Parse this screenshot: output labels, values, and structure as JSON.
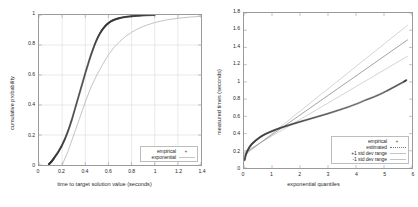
{
  "figure": {
    "background": "#ffffff",
    "frame_color": "#9a9a9a",
    "grid_color": "#d9d9d9",
    "empirical_color": "#3a3a3a",
    "fit_color": "#a8a8a8",
    "band_color": "#c9c9c9"
  },
  "chart_data": [
    {
      "type": "line",
      "title": "",
      "xlabel": "time to target solution value (seconds)",
      "ylabel": "cumulative probability",
      "xlim": [
        0,
        1.4
      ],
      "ylim": [
        0,
        1
      ],
      "xticks": [
        "0",
        "0.2",
        "0.4",
        "0.6",
        "0.8",
        "1",
        "1.2",
        "1.4"
      ],
      "xtick_values": [
        0,
        0.2,
        0.4,
        0.6,
        0.8,
        1,
        1.2,
        1.4
      ],
      "yticks": [
        "0",
        "0.2",
        "0.4",
        "0.6",
        "0.8",
        "1"
      ],
      "ytick_values": [
        0,
        0.2,
        0.4,
        0.6,
        0.8,
        1
      ],
      "grid": true,
      "legend_position": "bottom-right",
      "series": [
        {
          "name": "empirical",
          "style": "points",
          "marker": "+",
          "x": [
            0.085,
            0.095,
            0.105,
            0.115,
            0.125,
            0.135,
            0.15,
            0.165,
            0.18,
            0.195,
            0.21,
            0.225,
            0.24,
            0.255,
            0.27,
            0.285,
            0.3,
            0.315,
            0.33,
            0.345,
            0.36,
            0.375,
            0.39,
            0.405,
            0.42,
            0.435,
            0.45,
            0.465,
            0.48,
            0.495,
            0.51,
            0.525,
            0.54,
            0.555,
            0.57,
            0.585,
            0.6,
            0.62,
            0.64,
            0.66,
            0.68,
            0.7,
            0.73,
            0.76,
            0.79,
            0.82,
            0.85,
            0.88,
            0.92,
            0.96,
            1.0
          ],
          "y": [
            0.005,
            0.012,
            0.02,
            0.03,
            0.04,
            0.052,
            0.068,
            0.085,
            0.105,
            0.125,
            0.15,
            0.175,
            0.205,
            0.235,
            0.27,
            0.305,
            0.345,
            0.385,
            0.425,
            0.465,
            0.505,
            0.545,
            0.585,
            0.625,
            0.662,
            0.7,
            0.735,
            0.768,
            0.8,
            0.828,
            0.853,
            0.875,
            0.894,
            0.91,
            0.924,
            0.936,
            0.946,
            0.957,
            0.965,
            0.971,
            0.976,
            0.98,
            0.985,
            0.988,
            0.991,
            0.993,
            0.995,
            0.996,
            0.998,
            0.999,
            1.0
          ]
        },
        {
          "name": "exponential",
          "style": "line",
          "x": [
            0.2,
            0.25,
            0.3,
            0.35,
            0.4,
            0.45,
            0.5,
            0.55,
            0.6,
            0.65,
            0.7,
            0.75,
            0.8,
            0.85,
            0.9,
            1.0,
            1.1,
            1.2,
            1.3,
            1.4
          ],
          "y": [
            0.0,
            0.09,
            0.2,
            0.31,
            0.42,
            0.52,
            0.6,
            0.67,
            0.735,
            0.785,
            0.825,
            0.858,
            0.885,
            0.906,
            0.924,
            0.95,
            0.967,
            0.978,
            0.986,
            0.991
          ]
        }
      ]
    },
    {
      "type": "scatter",
      "title": "",
      "xlabel": "exponential quantiles",
      "ylabel": "measured times (seconds)",
      "xlim": [
        0,
        6
      ],
      "ylim": [
        0,
        1.8
      ],
      "xticks": [
        "0",
        "1",
        "2",
        "3",
        "4",
        "5",
        "6"
      ],
      "xtick_values": [
        0,
        1,
        2,
        3,
        4,
        5,
        6
      ],
      "yticks": [
        "0",
        "0.2",
        "0.4",
        "0.6",
        "0.8",
        "1",
        "1.2",
        "1.4",
        "1.6",
        "1.8"
      ],
      "ytick_values": [
        0,
        0.2,
        0.4,
        0.6,
        0.8,
        1,
        1.2,
        1.4,
        1.6,
        1.8
      ],
      "grid": false,
      "legend_position": "bottom-right",
      "series": [
        {
          "name": "empirical",
          "style": "points",
          "marker": "+",
          "x": [
            0.02,
            0.05,
            0.09,
            0.14,
            0.2,
            0.27,
            0.35,
            0.44,
            0.54,
            0.64,
            0.75,
            0.87,
            1.0,
            1.13,
            1.27,
            1.42,
            1.58,
            1.75,
            1.93,
            2.12,
            2.32,
            2.53,
            2.75,
            2.98,
            3.22,
            3.48,
            3.75,
            4.05,
            4.35,
            4.6,
            4.85,
            5.1,
            5.3,
            5.5,
            5.7,
            5.8
          ],
          "y": [
            0.09,
            0.135,
            0.175,
            0.21,
            0.245,
            0.275,
            0.3,
            0.325,
            0.35,
            0.372,
            0.392,
            0.41,
            0.428,
            0.445,
            0.462,
            0.478,
            0.495,
            0.512,
            0.53,
            0.548,
            0.567,
            0.587,
            0.608,
            0.63,
            0.655,
            0.682,
            0.712,
            0.748,
            0.79,
            0.82,
            0.855,
            0.895,
            0.93,
            0.965,
            1.0,
            1.02
          ]
        },
        {
          "name": "estimated",
          "style": "line",
          "x": [
            0,
            5.85
          ],
          "y": [
            0.16,
            1.49
          ]
        },
        {
          "name": "+1 std dev range",
          "style": "line",
          "x": [
            0,
            5.85
          ],
          "y": [
            0.14,
            1.66
          ]
        },
        {
          "name": "-1 std dev range",
          "style": "line",
          "x": [
            0,
            5.85
          ],
          "y": [
            0.18,
            1.3
          ]
        }
      ]
    }
  ]
}
